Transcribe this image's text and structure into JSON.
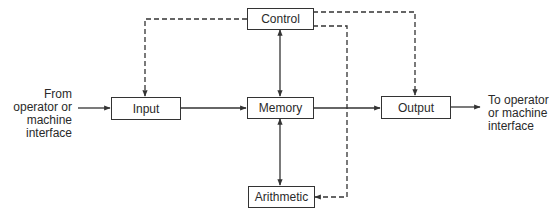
{
  "diagram": {
    "type": "block-diagram",
    "nodes": {
      "control": "Control",
      "input": "Input",
      "memory": "Memory",
      "output": "Output",
      "arithmetic": "Arithmetic"
    },
    "external": {
      "source": [
        "From",
        "operator or",
        "machine",
        "interface"
      ],
      "sink": [
        "To operator",
        "or machine",
        "interface"
      ]
    },
    "edges": [
      {
        "from": "source",
        "to": "input",
        "style": "solid"
      },
      {
        "from": "input",
        "to": "memory",
        "style": "solid"
      },
      {
        "from": "memory",
        "to": "output",
        "style": "solid"
      },
      {
        "from": "output",
        "to": "sink",
        "style": "solid"
      },
      {
        "from": "control",
        "to": "memory",
        "style": "solid",
        "bidirectional": true
      },
      {
        "from": "memory",
        "to": "arithmetic",
        "style": "solid",
        "bidirectional": true
      },
      {
        "from": "control",
        "to": "input",
        "style": "dashed"
      },
      {
        "from": "control",
        "to": "output",
        "style": "dashed"
      },
      {
        "from": "control",
        "to": "arithmetic",
        "style": "dashed"
      }
    ],
    "colors": {
      "line": "#333333",
      "background": "#ffffff"
    }
  }
}
